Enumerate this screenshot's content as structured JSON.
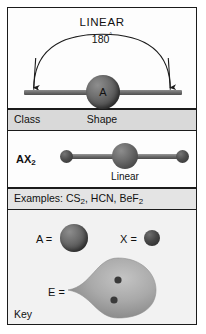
{
  "diagram": {
    "top_panel": {
      "title": "LINEAR",
      "angle_value": "180",
      "angle_unit": "°",
      "central_atom_label": "A",
      "arrow_count": 2
    },
    "table": {
      "header": {
        "class_label": "Class",
        "shape_label": "Shape"
      },
      "rows": [
        {
          "class_formula_base": "AX",
          "class_formula_sub": "2",
          "shape_name": "Linear",
          "examples_prefix": "Examples: ",
          "examples": [
            {
              "base": "CS",
              "sub": "2"
            },
            {
              "base": "HCN",
              "sub": ""
            },
            {
              "base": "BeF",
              "sub": "2"
            }
          ],
          "examples_text": "Examples: CS2, HCN, BeF2"
        }
      ]
    },
    "key": {
      "title": "Key",
      "entries": [
        {
          "symbol": "A =",
          "meaning": "central-atom-sphere"
        },
        {
          "symbol": "X =",
          "meaning": "terminal-atom-sphere"
        },
        {
          "symbol": "E =",
          "meaning": "lone-pair-lobe"
        }
      ],
      "lone_pair_dots": 2
    },
    "colors": {
      "border": "#1b1b1b",
      "header_row_bg": "#d9d9d9",
      "examples_row_bg": "#e4e4e4",
      "key_bg": "#f2f2f2",
      "atom_dark": "#4a4a4a",
      "lobe_gray": "#a8a8a8",
      "text": "#111111"
    }
  }
}
